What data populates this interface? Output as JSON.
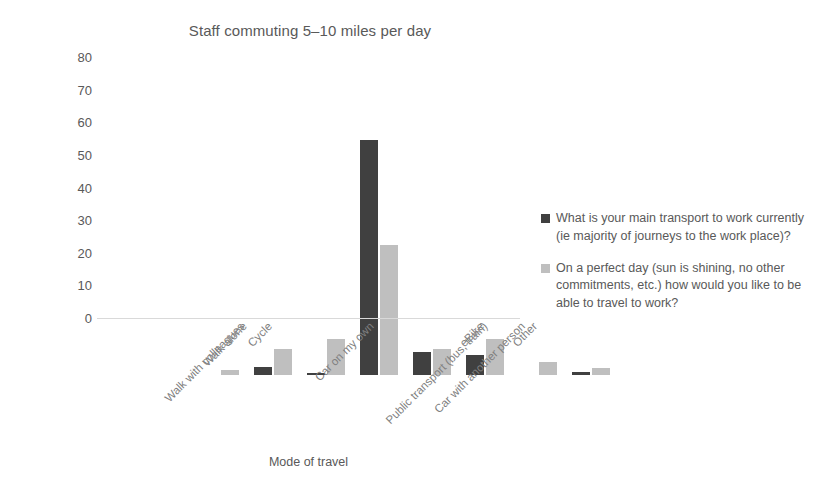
{
  "chart_data": {
    "type": "bar",
    "title": "Staff commuting 5–10 miles per day",
    "xlabel": "Mode of travel",
    "ylabel": "Number of staff",
    "ylim": [
      0,
      80
    ],
    "yticks": [
      0,
      10,
      20,
      30,
      40,
      50,
      60,
      70,
      80
    ],
    "grid": false,
    "legend_position": "right",
    "categories": [
      "Walk with colleagues",
      "Walk alone",
      "Cycle",
      "Car on my own",
      "Public transport (bus, train)",
      "Car with another person",
      "eBike",
      "Other"
    ],
    "series": [
      {
        "name": "What is your main transport to work currently (ie majority of journeys to the work place)?",
        "color": "#404040",
        "values": [
          0,
          2.5,
          0.5,
          72,
          7,
          6,
          0,
          1
        ]
      },
      {
        "name": "On a perfect day (sun is shining, no other commitments, etc.) how would you like to be able to travel to work?",
        "color": "#bfbfbf",
        "values": [
          1.5,
          8,
          11,
          40,
          8,
          11,
          4,
          2
        ]
      }
    ]
  },
  "colors": {
    "series_dark": "#404040",
    "series_light": "#bfbfbf",
    "axis_line": "#d9d9d9",
    "text": "#595959",
    "tick_text": "#7f7f7f",
    "background": "#ffffff"
  }
}
